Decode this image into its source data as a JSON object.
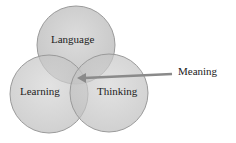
{
  "diagram": {
    "type": "venn",
    "sets": [
      {
        "id": "language",
        "label": "Language"
      },
      {
        "id": "learning",
        "label": "Learning"
      },
      {
        "id": "thinking",
        "label": "Thinking"
      }
    ],
    "callout": {
      "label": "Meaning",
      "points_to": "intersection of Language, Learning, Thinking"
    },
    "colors": {
      "circle_fill": "#c8c8c8",
      "circle_stroke": "#9a9a9a",
      "overlap_fill": "#8f8f8f",
      "arrow": "#8a8a8a",
      "text": "#222222"
    }
  }
}
